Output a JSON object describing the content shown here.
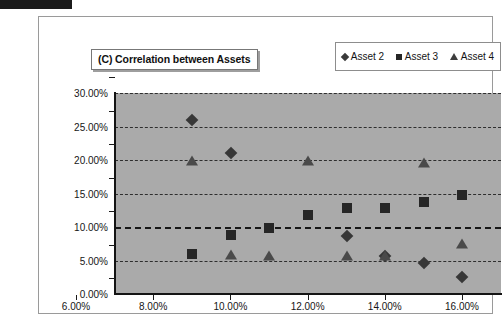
{
  "chart_data": {
    "type": "scatter",
    "title": "(C) Correlation between Assets",
    "xlabel": "",
    "ylabel": "",
    "xlim": [
      6.0,
      16.0
    ],
    "ylim": [
      0.0,
      30.0
    ],
    "grid": true,
    "legend_position": "top-right",
    "x_ticks": [
      "6.00%",
      "8.00%",
      "10.00%",
      "12.00%",
      "14.00%",
      "16.00%"
    ],
    "x_tick_values": [
      6,
      8,
      10,
      12,
      14,
      16
    ],
    "y_ticks": [
      "0.00%",
      "5.00%",
      "10.00%",
      "15.00%",
      "20.00%",
      "25.00%",
      "30.00%"
    ],
    "y_tick_values": [
      0,
      5,
      10,
      15,
      20,
      25,
      30
    ],
    "series": [
      {
        "name": "Asset 2",
        "marker": "diamond",
        "color": "#373737",
        "points": [
          {
            "x": 8.0,
            "y": 26.0
          },
          {
            "x": 9.0,
            "y": 21.0
          },
          {
            "x": 12.0,
            "y": 8.6
          },
          {
            "x": 13.0,
            "y": 5.6
          },
          {
            "x": 14.0,
            "y": 4.7
          },
          {
            "x": 15.0,
            "y": 2.5
          }
        ]
      },
      {
        "name": "Asset 3",
        "marker": "square",
        "color": "#262626",
        "points": [
          {
            "x": 8.0,
            "y": 6.0
          },
          {
            "x": 9.0,
            "y": 8.8
          },
          {
            "x": 10.0,
            "y": 9.8
          },
          {
            "x": 11.0,
            "y": 11.8
          },
          {
            "x": 12.0,
            "y": 12.8
          },
          {
            "x": 13.0,
            "y": 12.8
          },
          {
            "x": 14.0,
            "y": 13.8
          },
          {
            "x": 15.0,
            "y": 14.8
          }
        ]
      },
      {
        "name": "Asset 4",
        "marker": "triangle",
        "color": "#4a4a4a",
        "points": [
          {
            "x": 8.0,
            "y": 19.8
          },
          {
            "x": 9.0,
            "y": 5.8
          },
          {
            "x": 10.0,
            "y": 5.7
          },
          {
            "x": 11.0,
            "y": 19.8
          },
          {
            "x": 12.0,
            "y": 5.7
          },
          {
            "x": 13.0,
            "y": 5.6
          },
          {
            "x": 14.0,
            "y": 19.5
          },
          {
            "x": 15.0,
            "y": 7.5
          }
        ]
      }
    ]
  },
  "legend": {
    "entries": [
      {
        "label": "Asset 2",
        "marker": "diamond"
      },
      {
        "label": "Asset 3",
        "marker": "square"
      },
      {
        "label": "Asset 4",
        "marker": "triangle"
      }
    ]
  },
  "colors": {
    "plot_background": "#aaaaaa",
    "page_background": "#ffffff",
    "gridline": "#2e2e2e",
    "axis": "#141414"
  }
}
